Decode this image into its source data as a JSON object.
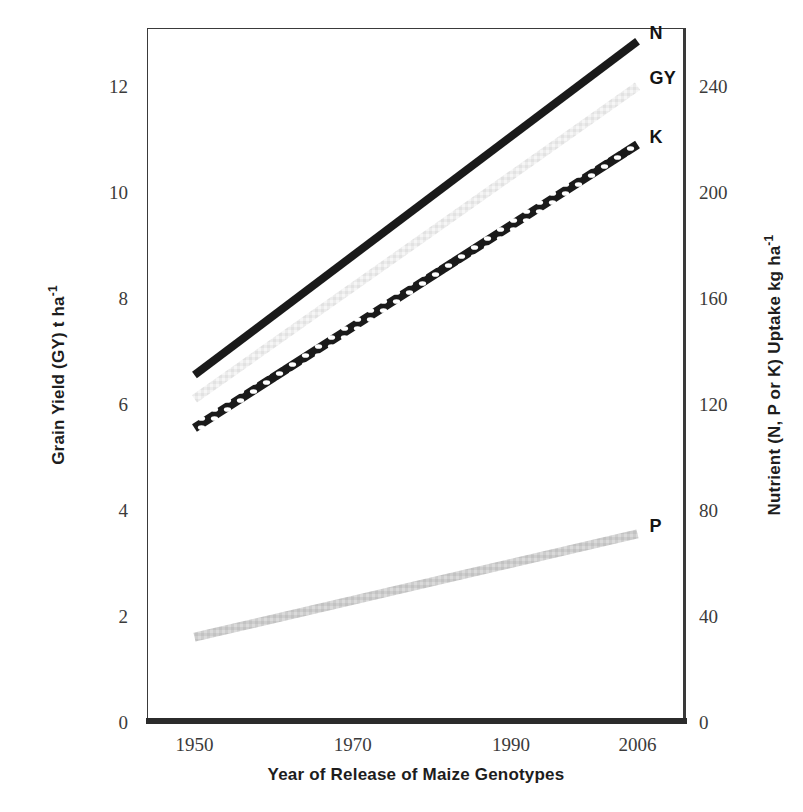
{
  "chart_data": {
    "type": "line",
    "title": "",
    "xlabel": "Year of Release of Maize Genotypes",
    "ylabel": "Grain Yield (GY) t ha-1",
    "ylabel_secondary": "Nutrient (N, P or K) Uptake kg ha-1",
    "x": [
      1950,
      2006
    ],
    "xlim": [
      1944,
      2012
    ],
    "xticks": [
      "1950",
      "1970",
      "1990",
      "2006"
    ],
    "xtick_values": [
      1950,
      1970,
      1990,
      2006
    ],
    "ylim": [
      0,
      13.1
    ],
    "yticks": [
      "0",
      "2",
      "4",
      "6",
      "8",
      "10",
      "12"
    ],
    "ytick_values": [
      0,
      2,
      4,
      6,
      8,
      10,
      12
    ],
    "ylim_secondary": [
      0,
      262
    ],
    "yticks_secondary": [
      "0",
      "40",
      "80",
      "120",
      "160",
      "200",
      "240"
    ],
    "ytick_values_secondary": [
      0,
      40,
      80,
      120,
      160,
      200,
      240
    ],
    "grid": false,
    "legend_position": "right-inline-end-of-line",
    "series": [
      {
        "name": "N",
        "axis": "secondary",
        "units": "kg ha-1",
        "style": "solid-thick-black",
        "color": "#1a1a1a",
        "x": [
          1950,
          2006
        ],
        "values": [
          131,
          257
        ]
      },
      {
        "name": "GY",
        "axis": "primary",
        "units": "t ha-1",
        "style": "solid-thick-very-light-gray",
        "color": "#e8e8e8",
        "x": [
          1950,
          2006
        ],
        "values": [
          6.1,
          12.0
        ]
      },
      {
        "name": "K",
        "axis": "secondary",
        "units": "kg ha-1",
        "style": "beaded-chain-black",
        "color": "#1a1a1a",
        "x": [
          1950,
          2006
        ],
        "values": [
          111,
          218
        ]
      },
      {
        "name": "P",
        "axis": "secondary",
        "units": "kg ha-1",
        "style": "solid-thick-light-gray",
        "color": "#c9c9c9",
        "x": [
          1950,
          2006
        ],
        "values": [
          32,
          71
        ]
      }
    ]
  },
  "axes": {
    "left_title_main": "Grain Yield (GY)  t ha",
    "left_title_sup": "-1",
    "right_title_main": "Nutrient (N, P or K)  Uptake kg ha",
    "right_title_sup": "-1",
    "x_title": "Year of Release of Maize Genotypes",
    "left_ticks": [
      "12",
      "10",
      "8",
      "6",
      "4",
      "2",
      "0"
    ],
    "right_ticks": [
      "240",
      "200",
      "160",
      "120",
      "80",
      "40",
      "0"
    ],
    "x_ticks": [
      "1950",
      "1970",
      "1990",
      "2006"
    ]
  },
  "series_labels": {
    "n": "N",
    "gy": "GY",
    "k": "K",
    "p": "P"
  },
  "colors": {
    "frame": "#3a3a3a",
    "text": "#231f20",
    "tick_text": "#3b3b3b",
    "series_n": "#1a1a1a",
    "series_gy": "#e8e8e8",
    "series_k": "#1a1a1a",
    "series_p": "#c9c9c9",
    "background": "#ffffff"
  }
}
